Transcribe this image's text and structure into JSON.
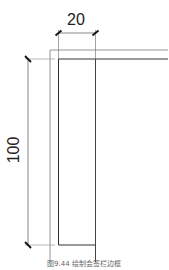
{
  "figure": {
    "caption": "图9.44  绘制会签栏边框",
    "dimensions": {
      "width_label": "20",
      "height_label": "100"
    },
    "colors": {
      "line": "#555555",
      "text": "#222222"
    }
  }
}
